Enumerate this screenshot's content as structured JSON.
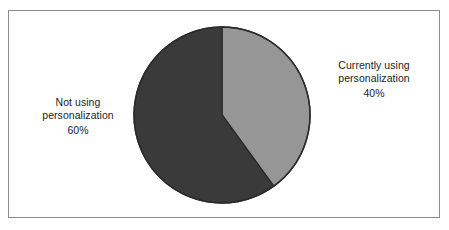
{
  "figure": {
    "background_color": "#ffffff",
    "frame_color": "#8c8c90"
  },
  "chart_data": {
    "type": "pie",
    "title": "",
    "subtitle": "",
    "xlabel": "",
    "ylabel": "",
    "legend_position": "none",
    "grid": false,
    "units": "percent",
    "start_angle_deg": 0,
    "direction": "clockwise",
    "categories": [
      "Currently using personalization",
      "Not using personalization"
    ],
    "values": [
      40,
      60
    ],
    "labels": [
      "40%",
      "60%"
    ],
    "colors": [
      "#969696",
      "#3a3a3a"
    ],
    "slices": [
      {
        "name": "Currently using personalization",
        "value": 40,
        "value_label": "40%",
        "color": "#969696",
        "outline_color": "#2b2b2b",
        "start_angle_deg": 0,
        "end_angle_deg": 144,
        "label_line_1": "Currently using",
        "label_line_2": "personalization",
        "label_position": "right"
      },
      {
        "name": "Not using personalization",
        "value": 60,
        "value_label": "60%",
        "color": "#3a3a3a",
        "outline_color": "#2b2b2b",
        "start_angle_deg": 144,
        "end_angle_deg": 360,
        "label_line_1": "Not using",
        "label_line_2": "personalization",
        "label_position": "left"
      }
    ]
  },
  "labels": {
    "right": {
      "line1": "Currently using",
      "line2": "personalization",
      "percent": "40%"
    },
    "left": {
      "line1": "Not using",
      "line2": "personalization",
      "percent": "60%"
    }
  }
}
